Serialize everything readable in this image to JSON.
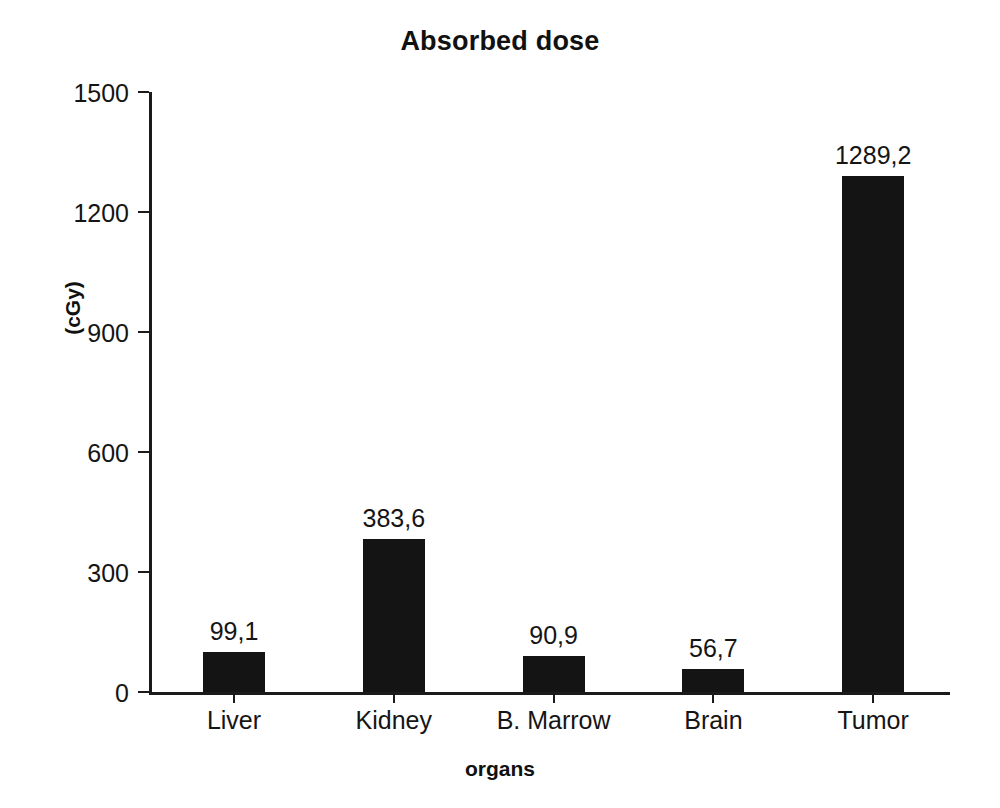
{
  "chart_data": {
    "type": "bar",
    "title": "Absorbed dose",
    "xlabel": "organs",
    "ylabel": "(cGy)",
    "categories": [
      "Liver",
      "Kidney",
      "B. Marrow",
      "Brain",
      "Tumor"
    ],
    "values": [
      99.1,
      383.6,
      90.9,
      56.7,
      1289.2
    ],
    "value_labels": [
      "99,1",
      "383,6",
      "90,9",
      "56,7",
      "1289,2"
    ],
    "ylim": [
      0,
      1500
    ],
    "yticks": [
      0,
      300,
      600,
      900,
      1200,
      1500
    ],
    "ytick_labels": [
      "0",
      "300",
      "600",
      "900",
      "1200",
      "1500"
    ],
    "grid": false,
    "legend": false,
    "bar_color": "#141414",
    "axis_color": "#1a1a1a",
    "background_color": "#ffffff",
    "decimal_separator": ","
  },
  "axes": {
    "y_title": "(cGy)",
    "x_title": "organs"
  },
  "title": {
    "text": "Absorbed dose"
  }
}
